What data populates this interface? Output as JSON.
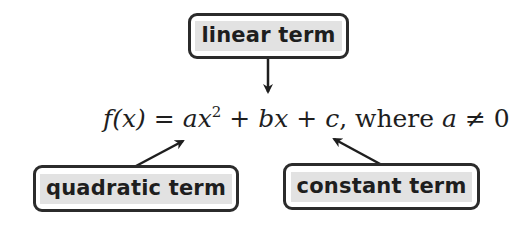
{
  "diagram": {
    "equation": {
      "lhs": "f(x)",
      "equals": "=",
      "term1_coef": "a",
      "term1_var": "x",
      "term1_exp": "2",
      "plus1": "+",
      "term2_coef": "b",
      "term2_var": "x",
      "plus2": "+",
      "term3": "c",
      "comma": ",",
      "where_text": "where",
      "condition_var": "a",
      "condition_op": "≠",
      "condition_val": "0"
    },
    "labels": {
      "linear": "linear term",
      "quadratic": "quadratic term",
      "constant": "constant term"
    },
    "colors": {
      "text": "#1e1e1e",
      "box_border": "#2b2b2b",
      "label_highlight": "#e2e2e2",
      "background": "#ffffff"
    }
  }
}
